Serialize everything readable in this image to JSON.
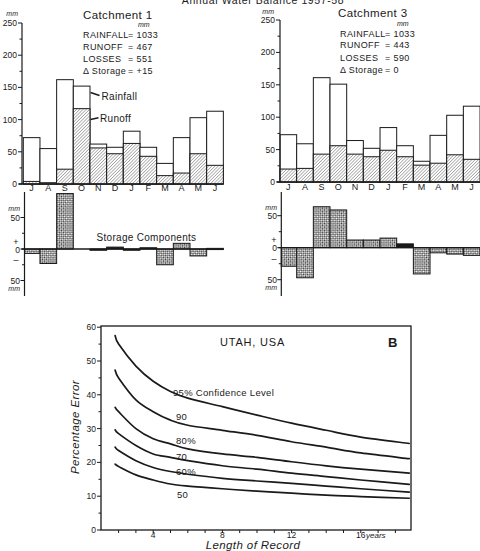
{
  "figure": {
    "title": "Annual Water Balance 1957-58",
    "catchment1": {
      "name": "Catchment 1",
      "unit": "mm",
      "rainfall_label": "RAINFALL",
      "rainfall_value": "= 1033",
      "runoff_label": "RUNOFF",
      "runoff_value": "= 467",
      "losses_label": "LOSSES",
      "losses_value": "= 551",
      "storage_label": "Δ Storage",
      "storage_value": "= +15",
      "legend_rainfall": "Rainfall",
      "legend_runoff": "Runoff",
      "storage_title": "Storage Components"
    },
    "catchment3": {
      "name": "Catchment 3",
      "unit": "mm",
      "rainfall_label": "RAINFALL",
      "rainfall_value": "= 1033",
      "runoff_label": "RUNOFF",
      "runoff_value": "= 443",
      "losses_label": "LOSSES",
      "losses_value": "= 590",
      "storage_label": "Δ Storage",
      "storage_value": "= 0"
    },
    "axes": {
      "unit": "mm",
      "fifty": "50",
      "plus": "+",
      "zero": "0",
      "minus": "–"
    },
    "utah": {
      "title": "UTAH, USA",
      "panel_label": "B",
      "xlabel": "Length of Record",
      "ylabel": "Percentage Error",
      "x_unit": "years",
      "curve_labels": [
        "95% Confidence Level",
        "90",
        "80%",
        "70",
        "60%",
        "50"
      ]
    }
  },
  "chart_data": [
    {
      "type": "bar",
      "title": "Catchment 1",
      "categories": [
        "J",
        "A",
        "S",
        "O",
        "N",
        "D",
        "J",
        "F",
        "M",
        "A",
        "M",
        "J"
      ],
      "series": [
        {
          "name": "Rainfall",
          "values": [
            72,
            55,
            162,
            152,
            62,
            57,
            82,
            57,
            32,
            72,
            103,
            113
          ]
        },
        {
          "name": "Runoff",
          "values": [
            4,
            2,
            23,
            117,
            56,
            47,
            63,
            43,
            13,
            17,
            47,
            29
          ]
        }
      ],
      "xlabel": "",
      "ylabel": "mm",
      "ylim": [
        0,
        250
      ],
      "yticks": [
        0,
        50,
        100,
        150,
        200,
        250
      ],
      "annotations": {
        "RAINFALL": 1033,
        "RUNOFF": 467,
        "LOSSES": 551,
        "Δ Storage": "+15"
      }
    },
    {
      "type": "bar",
      "title": "Storage Components (Catchment 1)",
      "categories": [
        "J",
        "A",
        "S",
        "O",
        "N",
        "D",
        "J",
        "F",
        "M",
        "A",
        "M",
        "J"
      ],
      "values": [
        -7,
        -23,
        88,
        0,
        -2,
        3,
        -2,
        2,
        -25,
        9,
        -11,
        1
      ],
      "ylabel": "mm",
      "ylim": [
        -50,
        90
      ],
      "yticks": [
        -50,
        0,
        50
      ]
    },
    {
      "type": "bar",
      "title": "Catchment 3",
      "categories": [
        "J",
        "A",
        "S",
        "O",
        "N",
        "D",
        "J",
        "F",
        "M",
        "A",
        "M",
        "J"
      ],
      "series": [
        {
          "name": "Rainfall",
          "values": [
            73,
            59,
            161,
            151,
            64,
            52,
            84,
            56,
            32,
            72,
            103,
            117
          ]
        },
        {
          "name": "Runoff",
          "values": [
            20,
            21,
            43,
            56,
            43,
            39,
            49,
            39,
            26,
            29,
            42,
            35
          ]
        }
      ],
      "xlabel": "",
      "ylabel": "mm",
      "ylim": [
        0,
        250
      ],
      "yticks": [
        0,
        50,
        100,
        150,
        200,
        250
      ],
      "annotations": {
        "RAINFALL": 1033,
        "RUNOFF": 443,
        "LOSSES": 590,
        "Δ Storage": "0"
      }
    },
    {
      "type": "bar",
      "title": "Storage Components (Catchment 3)",
      "categories": [
        "J",
        "A",
        "S",
        "O",
        "N",
        "D",
        "J",
        "F",
        "M",
        "A",
        "M",
        "J"
      ],
      "values": [
        -29,
        -47,
        64,
        59,
        12,
        12,
        15,
        6,
        -41,
        -8,
        -10,
        -12
      ],
      "ylabel": "mm",
      "ylim": [
        -50,
        70
      ],
      "yticks": [
        -50,
        0,
        50
      ]
    },
    {
      "type": "line",
      "title": "UTAH, USA",
      "panel_label": "B",
      "xlabel": "Length of Record (years)",
      "ylabel": "Percentage Error",
      "xlim": [
        1,
        18.9
      ],
      "ylim": [
        0,
        60
      ],
      "xticks": [
        4,
        8,
        12,
        16
      ],
      "yticks": [
        0,
        10,
        20,
        30,
        40,
        50,
        60
      ],
      "grid": false,
      "x": [
        1.8,
        2,
        3,
        4,
        5,
        6,
        8,
        10,
        12,
        14,
        16,
        18.8
      ],
      "series": [
        {
          "name": "95% Confidence Level",
          "values": [
            57.5,
            55,
            48.5,
            44,
            41,
            39,
            36.5,
            34,
            31.6,
            29.5,
            27.5,
            25.6
          ]
        },
        {
          "name": "90%",
          "values": [
            47.3,
            45,
            38.5,
            35,
            32.5,
            31,
            29.5,
            28,
            26.1,
            24.5,
            22.8,
            21.1
          ]
        },
        {
          "name": "80%",
          "values": [
            36.3,
            35,
            30,
            27,
            25.5,
            24,
            22.5,
            21.5,
            20.2,
            19,
            18,
            16.8
          ]
        },
        {
          "name": "70%",
          "values": [
            29.6,
            28.5,
            25,
            22.5,
            21.5,
            20.5,
            19,
            18,
            16.8,
            15.8,
            14.8,
            13.5
          ]
        },
        {
          "name": "60%",
          "values": [
            24.5,
            23.5,
            20.5,
            18.5,
            17.3,
            16.5,
            15.3,
            14.5,
            13.8,
            13,
            12.2,
            11.2
          ]
        },
        {
          "name": "50%",
          "values": [
            19.5,
            18.8,
            16.3,
            14.8,
            13.6,
            13,
            12.2,
            11.5,
            10.9,
            10.3,
            9.9,
            9.4
          ]
        }
      ]
    }
  ]
}
